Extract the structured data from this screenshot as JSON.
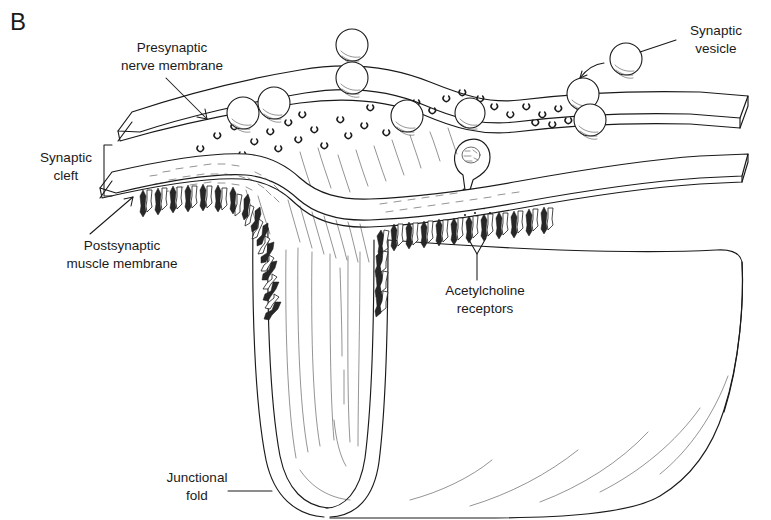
{
  "figure": {
    "panel_letter": "B",
    "background_color": "#ffffff",
    "ink_color": "#1a1a1a"
  },
  "labels": {
    "presynaptic": {
      "line1": "Presynaptic",
      "line2": "nerve membrane",
      "leader": "arrow",
      "text_x": 172,
      "text_y_line1": 52,
      "text_y_line2": 70
    },
    "synaptic_cleft": {
      "line1": "Synaptic",
      "line2": "cleft",
      "leader": "bracket",
      "text_x": 66,
      "text_y_line1": 162,
      "text_y_line2": 180
    },
    "postsynaptic": {
      "line1": "Postsynaptic",
      "line2": "muscle membrane",
      "leader": "arrow",
      "text_x": 122,
      "text_y_line1": 250,
      "text_y_line2": 268
    },
    "acetylcholine_receptors": {
      "line1": "Acetylcholine",
      "line2": "receptors",
      "leader": "forked",
      "text_x": 485,
      "text_y_line1": 295,
      "text_y_line2": 313
    },
    "synaptic_vesicle": {
      "line1": "Synaptic",
      "line2": "vesicle",
      "leader": "line",
      "text_x": 716,
      "text_y_line1": 35,
      "text_y_line2": 53
    },
    "junctional_fold": {
      "line1": "Junctional",
      "line2": "fold",
      "leader": "line",
      "text_x": 197,
      "text_y_line1": 482,
      "text_y_line2": 500
    }
  },
  "structures": {
    "presynaptic_terminal": "nerve-terminal-slab",
    "synaptic_cleft": "gap-between-membranes",
    "postsynaptic_membrane": "muscle-membrane-slab",
    "junctional_fold": "deep-u-shaped-invagination",
    "basal_lamina": "stippled-texture-in-cleft",
    "exocytosis_site": "fusing-vesicle-releasing-transmitter"
  },
  "vesicles": [
    {
      "cx": 243,
      "cy": 113,
      "r": 16
    },
    {
      "cx": 274,
      "cy": 103,
      "r": 16
    },
    {
      "cx": 352,
      "cy": 45,
      "r": 16
    },
    {
      "cx": 352,
      "cy": 78,
      "r": 16
    },
    {
      "cx": 407,
      "cy": 116,
      "r": 16
    },
    {
      "cx": 470,
      "cy": 113,
      "r": 15
    },
    {
      "cx": 583,
      "cy": 94,
      "r": 16
    },
    {
      "cx": 590,
      "cy": 120,
      "r": 16
    },
    {
      "cx": 626,
      "cy": 59,
      "r": 16
    }
  ],
  "counts": {
    "vesicles": 9,
    "receptor_groups": 3
  }
}
